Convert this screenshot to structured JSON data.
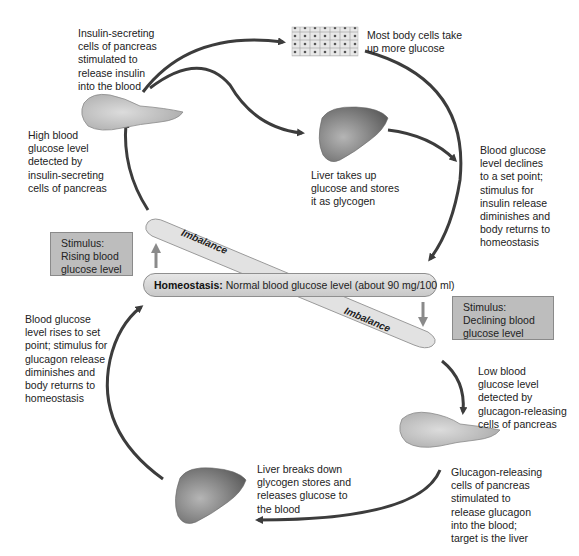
{
  "colors": {
    "arrow": "#3c3c3c",
    "stimulus_box": "#bdbdbd",
    "homeostasis_pill": "#d6d6d6",
    "imbalance_bar": "#e2e2e2",
    "organ": "#8a8a8a"
  },
  "top_loop": {
    "insulin_release": "Insulin-secreting\ncells of pancreas\nstimulated to\nrelease insulin\ninto the blood",
    "body_cells": "Most body cells take\nup more glucose",
    "liver_uptake": "Liver takes up\nglucose and stores\nit as glycogen",
    "high_detected": "High blood\nglucose level\ndetected by\ninsulin-secreting\ncells of pancreas",
    "declines": "Blood glucose\nlevel declines\nto a set point;\nstimulus for\ninsulin release\ndiminishes and\nbody returns to\nhomeostasis"
  },
  "stimulus_rising": "Stimulus:\nRising blood\nglucose level",
  "stimulus_declining": "Stimulus:\nDeclining blood\nglucose level",
  "homeostasis": {
    "label": "Homeostasis:",
    "text": " Normal blood glucose level (about 90 mg/100 ml)"
  },
  "imbalance_top": "Imbalance",
  "imbalance_bottom": "Imbalance",
  "bottom_loop": {
    "rises": "Blood glucose\nlevel rises to set\npoint; stimulus for\nglucagon release\ndiminishes and\nbody returns to\nhomeostasis",
    "low_detected": "Low blood\nglucose level\ndetected by\nglucagon-releasing\ncells of pancreas",
    "glucagon_release": "Glucagon-releasing\ncells of pancreas\nstimulated to\nrelease glucagon\ninto the blood;\ntarget is the liver",
    "liver_breakdown": "Liver breaks down\nglycogen stores and\nreleases glucose to\nthe blood"
  },
  "icons": [
    "pancreas-icon",
    "body-cells-icon",
    "liver-icon"
  ]
}
